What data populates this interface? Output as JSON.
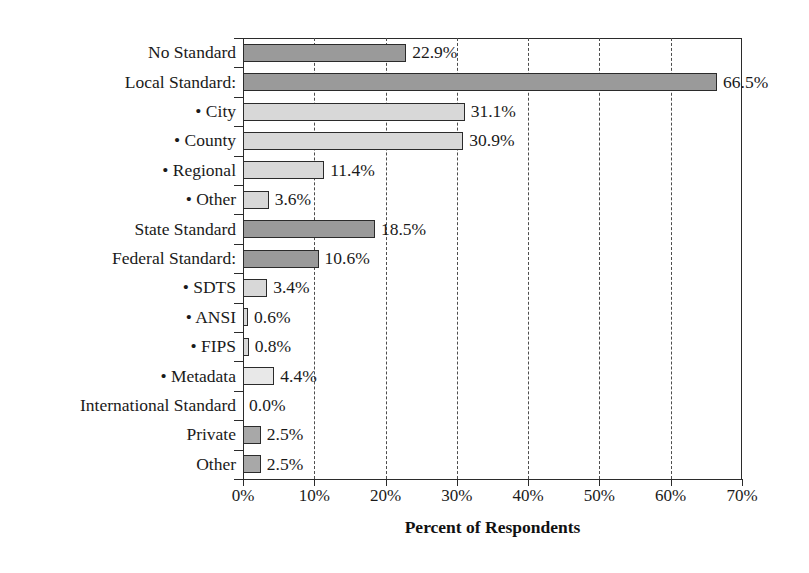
{
  "chart_data": {
    "type": "bar",
    "orientation": "horizontal",
    "title": "",
    "xlabel": "Percent of Respondents",
    "ylabel": "",
    "xlim": [
      0,
      70
    ],
    "xticks": [
      "0%",
      "10%",
      "20%",
      "30%",
      "40%",
      "50%",
      "60%",
      "70%"
    ],
    "xtick_values": [
      0,
      10,
      20,
      30,
      40,
      50,
      60,
      70
    ],
    "grid": "vertical-dashed",
    "legend": "none",
    "categories": [
      "No Standard",
      "Local Standard:",
      "• City",
      "• County",
      "• Regional",
      "• Other",
      "State Standard",
      "Federal Standard:",
      "• SDTS",
      "• ANSI",
      "• FIPS",
      "• Metadata",
      "International Standard",
      "Private",
      "Other"
    ],
    "values": [
      22.9,
      66.5,
      31.1,
      30.9,
      11.4,
      3.6,
      18.5,
      10.6,
      3.4,
      0.6,
      0.8,
      4.4,
      0.0,
      2.5,
      2.5
    ],
    "value_labels": [
      "22.9%",
      "66.5%",
      "31.1%",
      "30.9%",
      "11.4%",
      "3.6%",
      "18.5%",
      "10.6%",
      "3.4%",
      "0.6%",
      "0.8%",
      "4.4%",
      "0.0%",
      "2.5%",
      "2.5%"
    ],
    "bar_shades": [
      "dark",
      "dark",
      "light",
      "light",
      "light",
      "light",
      "dark",
      "dark",
      "light",
      "light",
      "light",
      "pale",
      "none",
      "mid",
      "mid"
    ],
    "colors": {
      "dark": "#9a9a9a",
      "mid": "#a8a8a8",
      "light": "#d8d8d8",
      "pale": "#e8e8e8",
      "outline": "#2b2b2b",
      "grid": "#4d4d4d",
      "text": "#1a1a1a",
      "background": "#ffffff"
    }
  }
}
